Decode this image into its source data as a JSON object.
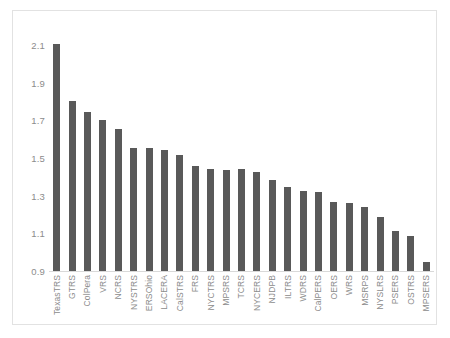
{
  "chart_data": {
    "type": "bar",
    "title": "",
    "subtitle": "",
    "xlabel": "",
    "ylabel": "",
    "ylim": [
      0.9,
      2.1
    ],
    "ytick_labels": [
      "2.1",
      "1.9",
      "1.7",
      "1.5",
      "1.3",
      "1.1",
      "0.9"
    ],
    "ytick_values": [
      2.1,
      1.9,
      1.7,
      1.5,
      1.3,
      1.1,
      0.9
    ],
    "grid": false,
    "legend": false,
    "legend_position": "none",
    "bar_color": "#595959",
    "axis_color": "#d9d9d9",
    "label_color": "#8c8c8c",
    "background_color": "#ffffff",
    "frame_color": "#e2e2e2",
    "categories": [
      "TexasTRS",
      "GTRS",
      "ColPera",
      "VRS",
      "NCRS",
      "NYSTRS",
      "ERSOhio",
      "LACERA",
      "CalSTRS",
      "FRS",
      "NYCTRS",
      "MPSRS",
      "TCRS",
      "NYCERS",
      "NJDPB",
      "ILTRS",
      "WDRS",
      "CalPERS",
      "OERS",
      "WRS",
      "MSRPS",
      "NYSLRS",
      "PSERS",
      "OSTRS",
      "MPSERS"
    ],
    "values": [
      2.105,
      1.805,
      1.745,
      1.7,
      1.655,
      1.555,
      1.553,
      1.545,
      1.515,
      1.455,
      1.44,
      1.435,
      1.44,
      1.425,
      1.385,
      1.345,
      1.325,
      1.32,
      1.265,
      1.26,
      1.24,
      1.185,
      1.115,
      1.085,
      0.95
    ]
  }
}
